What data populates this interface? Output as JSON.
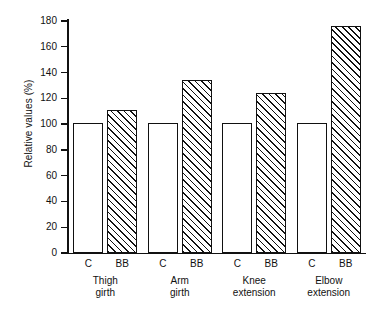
{
  "chart_data": {
    "type": "bar",
    "title": "",
    "subtitle": "",
    "xlabel": "",
    "ylabel": "Relative values (%)",
    "ylim": [
      0,
      180
    ],
    "ytick_step": 20,
    "yticks": [
      0,
      20,
      40,
      60,
      80,
      100,
      120,
      140,
      160,
      180
    ],
    "ytick_labels": [
      "0",
      "20",
      "40",
      "60",
      "80",
      "100",
      "120",
      "140",
      "160",
      "180"
    ],
    "grid": false,
    "legend": "none",
    "categories": [
      "Thigh girth",
      "Arm girth",
      "Knee extension",
      "Elbow extension"
    ],
    "category_lines": [
      [
        "Thigh",
        "girth"
      ],
      [
        "Arm",
        "girth"
      ],
      [
        "Knee",
        "extension"
      ],
      [
        "Elbow",
        "extension"
      ]
    ],
    "series": [
      {
        "name": "C",
        "label": "C",
        "fill": "white",
        "values": [
          101,
          101,
          101,
          101
        ]
      },
      {
        "name": "BB",
        "label": "BB",
        "fill": "diagonal-hatch",
        "values": [
          111,
          134,
          124,
          176
        ]
      }
    ],
    "colors": {
      "axis": "#111111",
      "bar_outline": "#111111",
      "bar_fill_c": "#ffffff",
      "bar_fill_bb": "#ffffff",
      "hatch": "#111111",
      "background": "#ffffff"
    }
  }
}
